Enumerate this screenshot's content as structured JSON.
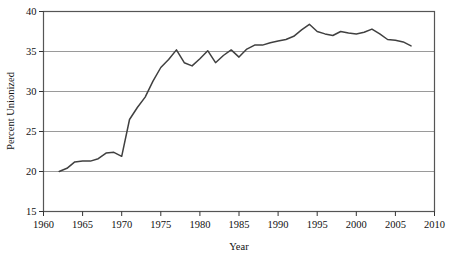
{
  "chart_data": {
    "type": "line",
    "title": "",
    "xlabel": "Year",
    "ylabel": "Percent Unionized",
    "xlim": [
      1960,
      2010
    ],
    "ylim": [
      15,
      40
    ],
    "xticks": [
      1960,
      1965,
      1970,
      1975,
      1980,
      1985,
      1990,
      1995,
      2000,
      2005,
      2010
    ],
    "yticks": [
      15,
      20,
      25,
      30,
      35,
      40
    ],
    "xtick_labels": [
      "1960",
      "1965",
      "1970",
      "1975",
      "1980",
      "1985",
      "1990",
      "1995",
      "2000",
      "2005",
      "2010"
    ],
    "ytick_labels": [
      "15",
      "20",
      "25",
      "30",
      "35",
      "40"
    ],
    "grid": "horizontal",
    "legend": "none",
    "line_color": "#404040",
    "grid_color": "#9a9a9a",
    "frame_color": "#555555",
    "background_color": "#ffffff",
    "series": [
      {
        "name": "Percent Unionized",
        "x": [
          1962,
          1963,
          1964,
          1965,
          1966,
          1967,
          1968,
          1969,
          1970,
          1971,
          1972,
          1973,
          1974,
          1975,
          1976,
          1977,
          1978,
          1979,
          1980,
          1981,
          1982,
          1983,
          1984,
          1985,
          1986,
          1987,
          1988,
          1989,
          1990,
          1991,
          1992,
          1993,
          1994,
          1995,
          1996,
          1997,
          1998,
          1999,
          2000,
          2001,
          2002,
          2003,
          2004,
          2005,
          2006,
          2007
        ],
        "values": [
          20.0,
          20.4,
          21.2,
          21.3,
          21.3,
          21.6,
          22.3,
          22.4,
          21.9,
          26.5,
          28.0,
          29.3,
          31.3,
          33.0,
          34.0,
          35.2,
          33.6,
          33.2,
          34.1,
          35.1,
          33.6,
          34.5,
          35.2,
          34.3,
          35.3,
          35.8,
          35.8,
          36.1,
          36.3,
          36.5,
          36.9,
          37.7,
          38.4,
          37.5,
          37.2,
          37.0,
          37.5,
          37.3,
          37.2,
          37.4,
          37.8,
          37.2,
          36.5,
          36.4,
          36.2,
          35.7
        ]
      }
    ]
  }
}
